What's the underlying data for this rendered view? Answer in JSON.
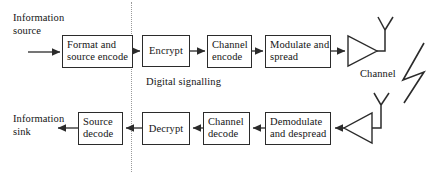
{
  "diagram": {
    "divider_label": "Digital signalling",
    "channel_label": "Channel",
    "endpoints": {
      "source": "Information\nsource",
      "sink": "Information\nsink"
    },
    "transmit_chain": [
      {
        "id": "format-source-encode",
        "label": "Format and\nsource encode"
      },
      {
        "id": "encrypt",
        "label": "Encrypt"
      },
      {
        "id": "channel-encode",
        "label": "Channel\nencode"
      },
      {
        "id": "modulate-spread",
        "label": "Modulate and\nspread"
      }
    ],
    "receive_chain": [
      {
        "id": "demodulate-despread",
        "label": "Demodulate\nand despread"
      },
      {
        "id": "channel-decode",
        "label": "Channel\ndecode"
      },
      {
        "id": "decrypt",
        "label": "Decrypt"
      },
      {
        "id": "source-decode",
        "label": "Source\ndecode"
      }
    ],
    "symbols": [
      {
        "id": "tx-amplifier",
        "name": "amplifier-triangle"
      },
      {
        "id": "tx-antenna",
        "name": "antenna"
      },
      {
        "id": "rx-amplifier",
        "name": "amplifier-triangle"
      },
      {
        "id": "rx-antenna",
        "name": "antenna"
      },
      {
        "id": "propagation",
        "name": "lightning-bolt"
      }
    ],
    "colors": {
      "stroke": "#2b2b2b",
      "divider": "#9a9a9a",
      "background": "#ffffff"
    }
  }
}
